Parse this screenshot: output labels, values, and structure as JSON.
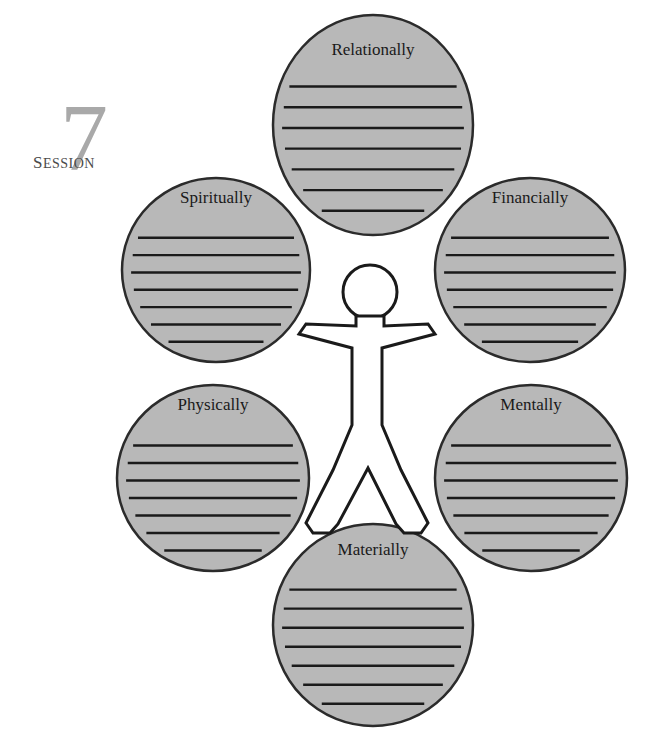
{
  "page": {
    "background_color": "#ffffff"
  },
  "session_marker": {
    "number": "7",
    "word": "Session",
    "number_color": "#a9a9a9",
    "word_color": "#4a4a4a"
  },
  "style": {
    "bubble_fill": "#b8b8b8",
    "bubble_stroke": "#2b2b2b",
    "rule_line_color": "#1a1a1a",
    "figure_fill": "#ffffff",
    "figure_stroke": "#1a1a1a",
    "label_color": "#1a1a1a"
  },
  "figure": {
    "name": "human-outline-figure"
  },
  "bubbles": [
    {
      "id": "relationally",
      "label": "Relationally",
      "position": "top",
      "cx": 373,
      "cy": 125,
      "rx": 100,
      "ry": 110,
      "label_y": 55,
      "line_count": 7
    },
    {
      "id": "spiritually",
      "label": "Spiritually",
      "position": "upper-left",
      "cx": 216,
      "cy": 270,
      "rx": 94,
      "ry": 92,
      "label_y": 203,
      "line_count": 7
    },
    {
      "id": "financially",
      "label": "Financially",
      "position": "upper-right",
      "cx": 530,
      "cy": 270,
      "rx": 95,
      "ry": 92,
      "label_y": 203,
      "line_count": 7
    },
    {
      "id": "physically",
      "label": "Physically",
      "position": "lower-left",
      "cx": 213,
      "cy": 478,
      "rx": 96,
      "ry": 93,
      "label_y": 410,
      "line_count": 7
    },
    {
      "id": "mentally",
      "label": "Mentally",
      "position": "lower-right",
      "cx": 531,
      "cy": 478,
      "rx": 96,
      "ry": 93,
      "label_y": 410,
      "line_count": 7
    },
    {
      "id": "materially",
      "label": "Materially",
      "position": "bottom",
      "cx": 373,
      "cy": 625,
      "rx": 100,
      "ry": 101,
      "label_y": 555,
      "line_count": 7
    }
  ]
}
